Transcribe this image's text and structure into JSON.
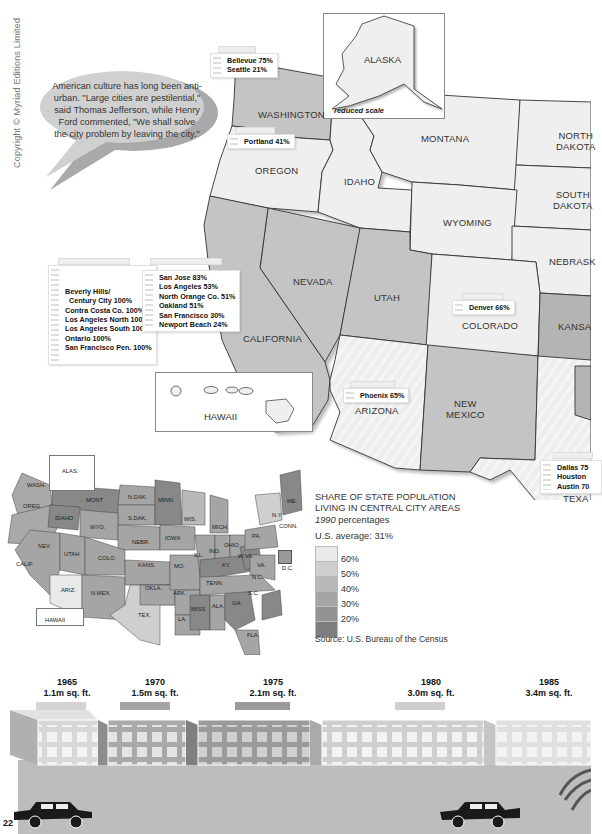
{
  "page": {
    "copyright": "Copyright © Myriad Editions Limited",
    "page_number": "22"
  },
  "quote": {
    "text": "American culture has long been anti-urban. \"Large cities are pestilential,\" said Thomas Jefferson, while Henry Ford commented, \"We shall solve the city problem by leaving the city.\""
  },
  "alaska_inset": {
    "label": "ALASKA",
    "note": "reduced scale"
  },
  "hawaii_inset": {
    "label": "HAWAII"
  },
  "states": {
    "washington": "WASHINGTON",
    "oregon": "OREGON",
    "idaho": "IDAHO",
    "montana": "MONTANA",
    "north_dakota_1": "NORTH",
    "north_dakota_2": "DAKOTA",
    "south_dakota_1": "SOUTH",
    "south_dakota_2": "DAKOTA",
    "wyoming": "WYOMING",
    "nebraska": "NEBRASK",
    "nevada": "NEVADA",
    "utah": "UTAH",
    "colorado": "COLORADO",
    "kansas": "KANSA",
    "california": "CALIFORNIA",
    "arizona": "ARIZONA",
    "new_mexico_1": "NEW",
    "new_mexico_2": "MEXICO",
    "texas": "TEXA"
  },
  "city_tags": {
    "washington": [
      "Bellevue 75%",
      "Seattle 21%"
    ],
    "oregon": [
      "Portland 41%"
    ],
    "california_a": [
      "Beverly Hills/",
      "  Century City 100%",
      "Contra Costa Co. 100%",
      "Los Angeles North 100%",
      "Los Angeles South 100%",
      "Ontario 100%",
      "San Francisco Pen. 100%"
    ],
    "california_b": [
      "San Jose 83%",
      "Los Angeles 53%",
      "North Orange Co. 51%",
      "Oakland 51%",
      "San Francisco 30%",
      "Newport Beach 24%"
    ],
    "colorado": [
      "Denver 66%"
    ],
    "arizona": [
      "Phoenix 65%"
    ],
    "texas": [
      "Dallas 75",
      "Houston ",
      "Austin 70"
    ]
  },
  "us_map": {
    "labels": {
      "alas": "ALAS.",
      "wash": "WASH.",
      "oreg": "OREG.",
      "idaho": "IDAHO",
      "mont": "MONT",
      "ndak": "N.DAK.",
      "minn": "MINN.",
      "sdak": "S.DAK.",
      "wis": "WIS.",
      "wyo": "WYO.",
      "mich": "MICH.",
      "ny": "N.Y.",
      "vt": "VT",
      "nh": "N.H.",
      "me": "ME.",
      "mass": "MASS.",
      "conn": "CONN.",
      "ri": "R.I.",
      "nebr": "NEBR.",
      "iowa": "IOWA",
      "pa": "PA.",
      "nj": "N.J.",
      "nev": "NEV.",
      "utah": "UTAH",
      "colo": "COLO.",
      "ill": "ILL.",
      "ind": "IND.",
      "ohio": "OHIO",
      "del": "DEL.",
      "calif": "CALIF.",
      "kans": "KANS.",
      "mo": "MO.",
      "ky": "KY.",
      "wva": "W.VA.",
      "va": "VA.",
      "dc": "D.C.",
      "nc": "N.C.",
      "tenn": "TENN.",
      "ariz": "ARIZ.",
      "nmex": "N.MEX.",
      "okla": "OKLA.",
      "ark": "ARK.",
      "sc": "S.C.",
      "miss": "MISS.",
      "ala": "ALA.",
      "ga": "GA.",
      "tex": "TEX.",
      "la": "LA.",
      "fla": "FLA.",
      "hawaii": "HAWAII"
    }
  },
  "legend": {
    "title_1": "SHARE OF STATE POPULATION",
    "title_2": "LIVING IN CENTRAL CITY AREAS",
    "year": "1990",
    "subtitle": " percentages",
    "average": "U.S. average: 31%",
    "bins": [
      {
        "label": "60%",
        "color": "#e9e9e9"
      },
      {
        "label": "50%",
        "color": "#cfcfcf"
      },
      {
        "label": "40%",
        "color": "#b9b9b9"
      },
      {
        "label": "30%",
        "color": "#a5a5a5"
      },
      {
        "label": "20%",
        "color": "#939393"
      },
      {
        "label": "",
        "color": "#7e7e7e"
      }
    ],
    "source": "Source: U.S. Bureau of the Census"
  },
  "timeline": [
    {
      "year": "1965",
      "area": "1.1m sq. ft."
    },
    {
      "year": "1970",
      "area": "1.5m sq. ft."
    },
    {
      "year": "1975",
      "area": "2.1m sq. ft."
    },
    {
      "year": "1980",
      "area": "3.0m sq. ft."
    },
    {
      "year": "1985",
      "area": "3.4m sq. ft."
    }
  ],
  "colors": {
    "state_light": "#f1f1f1",
    "state_mid": "#c8c8c8",
    "state_dark": "#b5b5b5",
    "road": "#bdbdbd",
    "building_1965": "#d8d8d8",
    "building_1970": "#a9a9a9",
    "building_1975": "#9b9b9b",
    "building_1980": "#cfcfcf",
    "building_1985": "#e0e0e0"
  }
}
